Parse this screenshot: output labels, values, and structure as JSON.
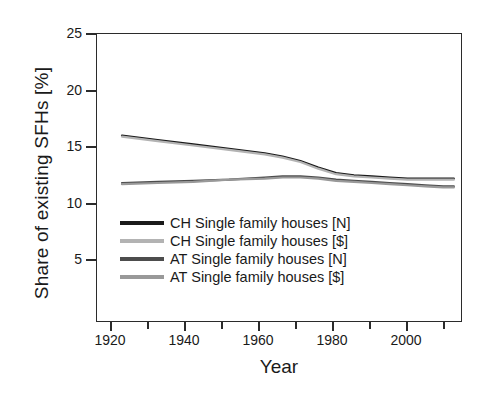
{
  "chart_data": {
    "type": "line",
    "title": "",
    "xlabel": "Year",
    "ylabel": "Share of existing SFHs [%]",
    "xlim": [
      1913,
      2015
    ],
    "ylim": [
      0,
      26
    ],
    "grid": false,
    "legend_position": "center-left inside axes",
    "xticks": [
      1920,
      1940,
      1960,
      1980,
      2000
    ],
    "xticks_minor": [
      1930,
      1950,
      1970,
      1990,
      2010
    ],
    "yticks": [
      5,
      10,
      15,
      20,
      25
    ],
    "x": [
      1920,
      1930,
      1940,
      1950,
      1960,
      1965,
      1970,
      1975,
      1980,
      1985,
      1990,
      1995,
      2000,
      2005,
      2010,
      2013
    ],
    "series": [
      {
        "name": "CH Single family houses [N]",
        "color": "#1a1a1a",
        "values": [
          16.8,
          16.4,
          16.0,
          15.6,
          15.2,
          14.9,
          14.5,
          13.9,
          13.4,
          13.2,
          13.1,
          13.0,
          12.9,
          12.9,
          12.9,
          12.9
        ]
      },
      {
        "name": "CH Single family houses [$]",
        "color": "#b3b3b3",
        "values": [
          16.7,
          16.3,
          15.9,
          15.5,
          15.1,
          14.8,
          14.4,
          13.8,
          13.3,
          13.1,
          13.0,
          12.9,
          12.8,
          12.8,
          12.8,
          12.8
        ]
      },
      {
        "name": "AT Single family houses [N]",
        "color": "#4d4d4d",
        "values": [
          12.5,
          12.6,
          12.7,
          12.8,
          13.0,
          13.1,
          13.1,
          13.0,
          12.8,
          12.7,
          12.6,
          12.5,
          12.4,
          12.3,
          12.2,
          12.2
        ]
      },
      {
        "name": "AT Single family houses [$]",
        "color": "#999999",
        "values": [
          12.4,
          12.5,
          12.6,
          12.8,
          12.9,
          13.0,
          13.0,
          12.9,
          12.7,
          12.6,
          12.5,
          12.4,
          12.3,
          12.2,
          12.1,
          12.1
        ]
      }
    ]
  },
  "axes": {
    "ylabel": "Share of existing SFHs [%]",
    "xlabel": "Year",
    "yticklabels": [
      "25",
      "20",
      "15",
      "10",
      "5"
    ],
    "xticklabels": [
      "1920",
      "1940",
      "1960",
      "1980",
      "2000"
    ]
  },
  "legend": {
    "items": [
      {
        "label": "CH Single family houses [N]",
        "color": "#1a1a1a"
      },
      {
        "label": "CH Single family houses [$]",
        "color": "#b3b3b3"
      },
      {
        "label": "AT Single family houses [N]",
        "color": "#4d4d4d"
      },
      {
        "label": "AT Single family houses [$]",
        "color": "#999999"
      }
    ]
  }
}
